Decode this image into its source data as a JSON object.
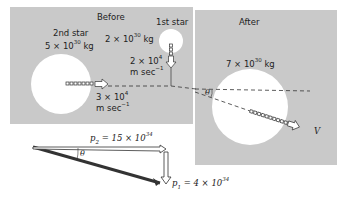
{
  "before": {
    "title": "Before",
    "star1": {
      "label": "1st star",
      "mass_base": "2 × 10",
      "mass_exp": "30",
      "mass_unit": " kg",
      "vel_base": "2 × 10",
      "vel_exp": "4",
      "vel_unit": "m sec",
      "vel_unit_exp": "−1"
    },
    "star2": {
      "label": "2nd star",
      "mass_base": "5 × 10",
      "mass_exp": "30",
      "mass_unit": " kg",
      "vel_base": "3 × 10",
      "vel_exp": "4",
      "vel_unit": "m sec",
      "vel_unit_exp": "−1"
    }
  },
  "after": {
    "title": "After",
    "merged": {
      "mass_base": "7 × 10",
      "mass_exp": "30",
      "mass_unit": " kg",
      "velocity_label": "V"
    },
    "angle_label": "θ"
  },
  "vectors": {
    "p2": {
      "sym": "p",
      "sub": "2",
      "val_base": " = 15 × 10",
      "val_exp": "34"
    },
    "p1": {
      "sym": "p",
      "sub": "1",
      "val_base": " = 4 × 10",
      "val_exp": "34"
    },
    "angle_label": "θ"
  }
}
